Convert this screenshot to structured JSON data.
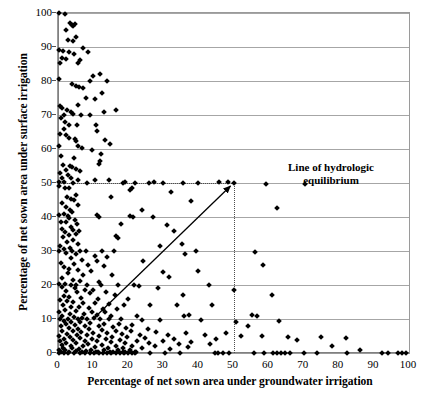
{
  "chart_data": {
    "type": "scatter",
    "title": "",
    "xlabel": "Percentage of net sown area under groundwater irrigation",
    "ylabel": "Percentage of net sown area under surface irrigation",
    "xlim": [
      0,
      100
    ],
    "ylim": [
      0,
      100
    ],
    "xticks": [
      0,
      10,
      20,
      30,
      40,
      50,
      60,
      70,
      80,
      90,
      100
    ],
    "yticks": [
      0,
      10,
      20,
      30,
      40,
      50,
      60,
      70,
      80,
      90,
      100
    ],
    "grid": "horizontal",
    "legend": "none",
    "marker": "diamond",
    "marker_color": "#000000",
    "annotations": [
      {
        "name": "line-of-hydrologic-equilibrium",
        "text_line1": "Line of hydrologic",
        "text_line2": "equilibrium",
        "arrow_from": [
          10,
          10
        ],
        "arrow_to": [
          50,
          50
        ]
      }
    ],
    "reference_lines": [
      {
        "name": "horizontal-50",
        "orientation": "horizontal",
        "value": 50,
        "from": 0,
        "to": 50,
        "style": "dotted"
      },
      {
        "name": "vertical-50",
        "orientation": "vertical",
        "value": 50,
        "from": 0,
        "to": 50,
        "style": "dotted"
      }
    ],
    "points": [
      [
        0.4,
        100
      ],
      [
        2.0,
        99.6
      ],
      [
        3.4,
        97.2
      ],
      [
        3.9,
        96.6
      ],
      [
        4.3,
        96.2
      ],
      [
        4.8,
        96.8
      ],
      [
        2.4,
        95.0
      ],
      [
        5.0,
        93.0
      ],
      [
        2.8,
        92.0
      ],
      [
        4.4,
        91.8
      ],
      [
        0.3,
        89.2
      ],
      [
        7.0,
        89.6
      ],
      [
        1.4,
        88.8
      ],
      [
        3.0,
        88.4
      ],
      [
        4.6,
        88.0
      ],
      [
        8.6,
        88.4
      ],
      [
        1.0,
        86.8
      ],
      [
        2.2,
        86.4
      ],
      [
        0.6,
        85.4
      ],
      [
        5.6,
        85.2
      ],
      [
        6.2,
        86.2
      ],
      [
        10.1,
        81.6
      ],
      [
        0.2,
        80.6
      ],
      [
        4.0,
        79.2
      ],
      [
        9.2,
        80.0
      ],
      [
        12.0,
        82.0
      ],
      [
        14.0,
        80.0
      ],
      [
        5.2,
        78.6
      ],
      [
        6.0,
        78.2
      ],
      [
        7.2,
        77.8
      ],
      [
        12.6,
        76.4
      ],
      [
        8.0,
        75.0
      ],
      [
        10.4,
        74.6
      ],
      [
        5.8,
        73.0
      ],
      [
        0.5,
        72.6
      ],
      [
        1.2,
        72.2
      ],
      [
        2.6,
        71.4
      ],
      [
        3.6,
        71.0
      ],
      [
        16.4,
        71.6
      ],
      [
        13.2,
        71.0
      ],
      [
        1.6,
        70.0
      ],
      [
        4.2,
        70.2
      ],
      [
        6.6,
        70.0
      ],
      [
        9.0,
        70.0
      ],
      [
        0.9,
        69.2
      ],
      [
        2.0,
        68.0
      ],
      [
        3.2,
        67.0
      ],
      [
        5.4,
        67.2
      ],
      [
        10.8,
        67.0
      ],
      [
        1.8,
        66.0
      ],
      [
        11.2,
        65.2
      ],
      [
        0.7,
        64.4
      ],
      [
        2.4,
        64.0
      ],
      [
        3.0,
        63.2
      ],
      [
        4.8,
        62.8
      ],
      [
        5.0,
        62.4
      ],
      [
        13.4,
        62.6
      ],
      [
        14.8,
        61.4
      ],
      [
        0.4,
        61.0
      ],
      [
        5.6,
        60.8
      ],
      [
        6.8,
        60.2
      ],
      [
        9.6,
        59.6
      ],
      [
        12.2,
        58.4
      ],
      [
        0.8,
        57.8
      ],
      [
        4.6,
        57.4
      ],
      [
        12.0,
        56.6
      ],
      [
        11.8,
        55.6
      ],
      [
        1.4,
        55.2
      ],
      [
        3.4,
        55.0
      ],
      [
        4.0,
        54.6
      ],
      [
        5.2,
        54.2
      ],
      [
        2.2,
        53.8
      ],
      [
        6.4,
        53.6
      ],
      [
        0.6,
        52.8
      ],
      [
        2.8,
        52.4
      ],
      [
        1.0,
        51.6
      ],
      [
        3.6,
        51.4
      ],
      [
        5.8,
        51.0
      ],
      [
        10.4,
        50.8
      ],
      [
        14.6,
        51.0
      ],
      [
        0.3,
        50.4
      ],
      [
        1.8,
        50.2
      ],
      [
        4.4,
        50.0
      ],
      [
        8.2,
        50.0
      ],
      [
        18.4,
        50.0
      ],
      [
        19.0,
        50.2
      ],
      [
        22.0,
        50.0
      ],
      [
        27.4,
        50.2
      ],
      [
        30.0,
        50.0
      ],
      [
        35.6,
        50.0
      ],
      [
        40.0,
        50.0
      ],
      [
        45.8,
        50.2
      ],
      [
        48.4,
        50.4
      ],
      [
        50.0,
        50.0
      ],
      [
        59.2,
        49.8
      ],
      [
        70.4,
        49.6
      ],
      [
        0.2,
        49.0
      ],
      [
        2.0,
        48.6
      ],
      [
        3.0,
        48.4
      ],
      [
        20.6,
        48.0
      ],
      [
        32.2,
        47.4
      ],
      [
        5.0,
        46.4
      ],
      [
        2.6,
        46.0
      ],
      [
        3.8,
        45.4
      ],
      [
        4.6,
        45.0
      ],
      [
        37.8,
        44.8
      ],
      [
        1.2,
        44.2
      ],
      [
        5.6,
        43.6
      ],
      [
        2.2,
        43.0
      ],
      [
        62.4,
        42.6
      ],
      [
        3.4,
        42.2
      ],
      [
        4.0,
        41.6
      ],
      [
        1.6,
        41.0
      ],
      [
        0.4,
        40.6
      ],
      [
        2.8,
        40.4
      ],
      [
        11.0,
        40.6
      ],
      [
        11.6,
        40.0
      ],
      [
        20.4,
        40.2
      ],
      [
        21.4,
        40.0
      ],
      [
        27.0,
        40.0
      ],
      [
        3.2,
        39.6
      ],
      [
        4.8,
        39.2
      ],
      [
        0.8,
        38.6
      ],
      [
        2.4,
        38.4
      ],
      [
        5.4,
        38.0
      ],
      [
        31.0,
        37.6
      ],
      [
        3.6,
        37.0
      ],
      [
        1.0,
        36.6
      ],
      [
        4.2,
        36.2
      ],
      [
        6.0,
        36.0
      ],
      [
        2.0,
        35.6
      ],
      [
        5.0,
        35.0
      ],
      [
        3.0,
        34.6
      ],
      [
        1.4,
        34.0
      ],
      [
        16.4,
        34.4
      ],
      [
        17.2,
        33.8
      ],
      [
        4.4,
        33.2
      ],
      [
        2.6,
        32.6
      ],
      [
        5.8,
        32.0
      ],
      [
        35.4,
        32.2
      ],
      [
        0.6,
        31.6
      ],
      [
        3.4,
        31.0
      ],
      [
        1.8,
        30.6
      ],
      [
        0.2,
        30.0
      ],
      [
        4.0,
        30.0
      ],
      [
        6.4,
        30.0
      ],
      [
        8.0,
        30.0
      ],
      [
        12.6,
        30.0
      ],
      [
        16.0,
        30.0
      ],
      [
        39.2,
        30.0
      ],
      [
        56.0,
        29.6
      ],
      [
        2.2,
        29.4
      ],
      [
        5.2,
        29.0
      ],
      [
        10.4,
        28.6
      ],
      [
        14.0,
        28.2
      ],
      [
        3.8,
        27.8
      ],
      [
        6.8,
        27.4
      ],
      [
        11.2,
        27.0
      ],
      [
        24.2,
        27.2
      ],
      [
        0.9,
        26.6
      ],
      [
        4.6,
        26.2
      ],
      [
        8.6,
        26.0
      ],
      [
        13.0,
        25.6
      ],
      [
        58.4,
        25.8
      ],
      [
        1.6,
        25.2
      ],
      [
        3.0,
        24.8
      ],
      [
        5.6,
        24.4
      ],
      [
        9.4,
        24.2
      ],
      [
        30.0,
        23.8
      ],
      [
        2.8,
        23.4
      ],
      [
        7.0,
        23.0
      ],
      [
        15.4,
        22.8
      ],
      [
        31.6,
        22.4
      ],
      [
        1.2,
        22.0
      ],
      [
        4.2,
        21.6
      ],
      [
        6.2,
        21.2
      ],
      [
        11.8,
        21.0
      ],
      [
        0.4,
        20.4
      ],
      [
        2.0,
        20.2
      ],
      [
        3.6,
        20.0
      ],
      [
        5.0,
        20.0
      ],
      [
        8.2,
        20.0
      ],
      [
        12.2,
        20.0
      ],
      [
        17.0,
        20.0
      ],
      [
        21.6,
        20.0
      ],
      [
        23.0,
        19.6
      ],
      [
        28.4,
        19.2
      ],
      [
        1.0,
        19.4
      ],
      [
        4.8,
        19.0
      ],
      [
        7.6,
        18.6
      ],
      [
        10.0,
        18.4
      ],
      [
        13.8,
        18.0
      ],
      [
        2.4,
        18.2
      ],
      [
        5.4,
        17.8
      ],
      [
        9.0,
        17.6
      ],
      [
        16.2,
        17.2
      ],
      [
        35.6,
        17.0
      ],
      [
        61.0,
        17.0
      ],
      [
        1.8,
        16.8
      ],
      [
        3.2,
        16.4
      ],
      [
        6.6,
        16.2
      ],
      [
        11.4,
        16.0
      ],
      [
        20.0,
        16.0
      ],
      [
        0.6,
        15.6
      ],
      [
        2.6,
        15.2
      ],
      [
        4.4,
        15.0
      ],
      [
        7.2,
        14.8
      ],
      [
        10.6,
        14.6
      ],
      [
        14.6,
        14.4
      ],
      [
        18.8,
        14.2
      ],
      [
        26.2,
        14.2
      ],
      [
        34.0,
        14.0
      ],
      [
        44.0,
        14.0
      ],
      [
        1.4,
        14.0
      ],
      [
        3.8,
        13.6
      ],
      [
        6.0,
        13.4
      ],
      [
        8.8,
        13.2
      ],
      [
        12.8,
        13.0
      ],
      [
        16.8,
        12.8
      ],
      [
        2.0,
        12.6
      ],
      [
        5.2,
        12.4
      ],
      [
        9.6,
        12.2
      ],
      [
        13.4,
        12.0
      ],
      [
        0.3,
        12.0
      ],
      [
        3.4,
        11.6
      ],
      [
        7.4,
        11.4
      ],
      [
        11.0,
        11.2
      ],
      [
        15.2,
        11.0
      ],
      [
        22.4,
        11.0
      ],
      [
        55.4,
        11.2
      ],
      [
        56.6,
        11.0
      ],
      [
        1.0,
        10.8
      ],
      [
        4.6,
        10.6
      ],
      [
        6.8,
        10.4
      ],
      [
        10.2,
        10.2
      ],
      [
        0.5,
        10.0
      ],
      [
        2.8,
        10.0
      ],
      [
        5.6,
        10.0
      ],
      [
        8.4,
        10.0
      ],
      [
        12.0,
        10.0
      ],
      [
        14.4,
        10.0
      ],
      [
        18.0,
        10.0
      ],
      [
        24.0,
        9.8
      ],
      [
        29.0,
        9.6
      ],
      [
        40.6,
        9.6
      ],
      [
        63.0,
        9.4
      ],
      [
        1.6,
        9.4
      ],
      [
        3.6,
        9.2
      ],
      [
        6.2,
        9.0
      ],
      [
        9.2,
        8.8
      ],
      [
        13.0,
        8.6
      ],
      [
        17.4,
        8.4
      ],
      [
        21.0,
        8.2
      ],
      [
        2.2,
        8.4
      ],
      [
        4.8,
        8.2
      ],
      [
        7.8,
        8.0
      ],
      [
        11.6,
        7.8
      ],
      [
        15.8,
        7.6
      ],
      [
        19.4,
        7.4
      ],
      [
        25.6,
        7.2
      ],
      [
        0.8,
        7.8
      ],
      [
        3.0,
        7.4
      ],
      [
        5.8,
        7.2
      ],
      [
        8.8,
        7.0
      ],
      [
        12.4,
        6.8
      ],
      [
        16.6,
        6.6
      ],
      [
        20.8,
        6.4
      ],
      [
        28.0,
        6.2
      ],
      [
        36.4,
        6.0
      ],
      [
        48.0,
        6.0
      ],
      [
        1.2,
        6.6
      ],
      [
        4.2,
        6.4
      ],
      [
        6.6,
        6.2
      ],
      [
        10.0,
        6.0
      ],
      [
        14.0,
        5.8
      ],
      [
        18.2,
        5.6
      ],
      [
        23.4,
        5.4
      ],
      [
        31.4,
        5.2
      ],
      [
        41.8,
        5.2
      ],
      [
        52.0,
        5.0
      ],
      [
        58.0,
        5.0
      ],
      [
        65.4,
        4.8
      ],
      [
        75.0,
        4.6
      ],
      [
        82.0,
        4.4
      ],
      [
        2.6,
        5.6
      ],
      [
        5.4,
        5.4
      ],
      [
        8.2,
        5.2
      ],
      [
        11.8,
        5.0
      ],
      [
        15.4,
        4.8
      ],
      [
        19.8,
        4.6
      ],
      [
        24.8,
        4.4
      ],
      [
        33.0,
        4.2
      ],
      [
        45.0,
        4.0
      ],
      [
        0.4,
        5.0
      ],
      [
        3.4,
        4.6
      ],
      [
        6.4,
        4.4
      ],
      [
        9.8,
        4.2
      ],
      [
        13.6,
        4.0
      ],
      [
        17.8,
        3.8
      ],
      [
        22.6,
        3.6
      ],
      [
        29.8,
        3.4
      ],
      [
        38.0,
        3.2
      ],
      [
        1.8,
        4.0
      ],
      [
        4.4,
        3.8
      ],
      [
        7.6,
        3.6
      ],
      [
        11.2,
        3.4
      ],
      [
        15.0,
        3.2
      ],
      [
        19.2,
        3.0
      ],
      [
        26.0,
        2.8
      ],
      [
        34.6,
        2.6
      ],
      [
        43.2,
        2.6
      ],
      [
        0.6,
        3.4
      ],
      [
        2.4,
        3.0
      ],
      [
        5.0,
        2.8
      ],
      [
        8.6,
        2.6
      ],
      [
        12.6,
        2.4
      ],
      [
        16.4,
        2.2
      ],
      [
        21.2,
        2.0
      ],
      [
        27.6,
        2.0
      ],
      [
        37.0,
        1.8
      ],
      [
        1.0,
        2.4
      ],
      [
        3.8,
        2.2
      ],
      [
        7.0,
        2.0
      ],
      [
        10.4,
        1.8
      ],
      [
        14.2,
        1.6
      ],
      [
        18.6,
        1.4
      ],
      [
        23.8,
        1.4
      ],
      [
        32.0,
        1.2
      ],
      [
        1.4,
        1.6
      ],
      [
        4.0,
        1.4
      ],
      [
        6.0,
        1.2
      ],
      [
        9.4,
        1.0
      ],
      [
        13.2,
        1.0
      ],
      [
        17.2,
        0.8
      ],
      [
        20.4,
        0.8
      ],
      [
        0.2,
        1.0
      ],
      [
        2.0,
        0.8
      ],
      [
        5.2,
        0.6
      ],
      [
        8.0,
        0.6
      ],
      [
        11.4,
        0.4
      ],
      [
        15.6,
        0.4
      ],
      [
        19.0,
        0.4
      ],
      [
        22.2,
        0.4
      ],
      [
        0.8,
        0.3
      ],
      [
        3.2,
        0.2
      ],
      [
        6.8,
        0.2
      ],
      [
        10.8,
        0.2
      ],
      [
        14.8,
        0.2
      ],
      [
        18.4,
        0.2
      ],
      [
        21.8,
        0.2
      ],
      [
        0.4,
        0.0
      ],
      [
        1.6,
        0.0
      ],
      [
        2.8,
        0.0
      ],
      [
        4.6,
        0.0
      ],
      [
        6.2,
        0.0
      ],
      [
        7.8,
        0.0
      ],
      [
        9.0,
        0.0
      ],
      [
        10.2,
        0.0
      ],
      [
        11.6,
        0.0
      ],
      [
        12.8,
        0.0
      ],
      [
        14.0,
        0.0
      ],
      [
        15.2,
        0.0
      ],
      [
        16.4,
        0.0
      ],
      [
        17.6,
        0.0
      ],
      [
        18.8,
        0.0
      ],
      [
        20.0,
        0.0
      ],
      [
        21.0,
        0.0
      ],
      [
        22.0,
        0.0
      ],
      [
        26.2,
        0.0
      ],
      [
        30.4,
        0.0
      ],
      [
        34.8,
        0.0
      ],
      [
        44.6,
        0.0
      ],
      [
        45.6,
        0.0
      ],
      [
        47.0,
        0.0
      ],
      [
        48.8,
        0.0
      ],
      [
        55.8,
        0.0
      ],
      [
        58.6,
        0.0
      ],
      [
        61.2,
        0.0
      ],
      [
        62.4,
        0.0
      ],
      [
        63.6,
        0.0
      ],
      [
        64.8,
        0.0
      ],
      [
        66.0,
        0.0
      ],
      [
        70.2,
        0.0
      ],
      [
        73.8,
        0.0
      ],
      [
        82.4,
        0.0
      ],
      [
        92.4,
        0.0
      ],
      [
        94.0,
        0.0
      ],
      [
        96.8,
        0.0
      ],
      [
        98.0,
        0.0
      ],
      [
        99.2,
        0.0
      ],
      [
        26.0,
        50.0
      ],
      [
        21.0,
        48.4
      ],
      [
        15.0,
        46.0
      ],
      [
        24.0,
        42.0
      ],
      [
        18.0,
        38.0
      ],
      [
        33.0,
        36.0
      ],
      [
        29.0,
        31.6
      ],
      [
        36.2,
        29.0
      ],
      [
        40.0,
        24.0
      ],
      [
        43.0,
        20.0
      ],
      [
        50.0,
        18.4
      ],
      [
        36.0,
        11.0
      ],
      [
        37.2,
        11.2
      ],
      [
        50.6,
        9.0
      ],
      [
        54.0,
        8.0
      ],
      [
        68.0,
        3.8
      ],
      [
        78.0,
        2.0
      ],
      [
        86.0,
        1.0
      ]
    ]
  },
  "axes": {
    "x_title": "Percentage of net sown area under groundwater irrigation",
    "y_title": "Percentage of net sown area under surface irrigation",
    "x_tick_labels": [
      "0",
      "10",
      "20",
      "30",
      "40",
      "50",
      "60",
      "70",
      "80",
      "90",
      "100"
    ],
    "y_tick_labels": [
      "0",
      "10",
      "20",
      "30",
      "40",
      "50",
      "60",
      "70",
      "80",
      "90",
      "100"
    ]
  },
  "annotation": {
    "line1": "Line of hydrologic",
    "line2": "equilibrium"
  },
  "colors": {
    "marker": "#000000",
    "gridline": "#a6a6a6",
    "axis": "#808080",
    "plot_border": "#9a9a9a",
    "background": "#ffffff",
    "text": "#000000",
    "reference_line": "#4d4d4d"
  }
}
